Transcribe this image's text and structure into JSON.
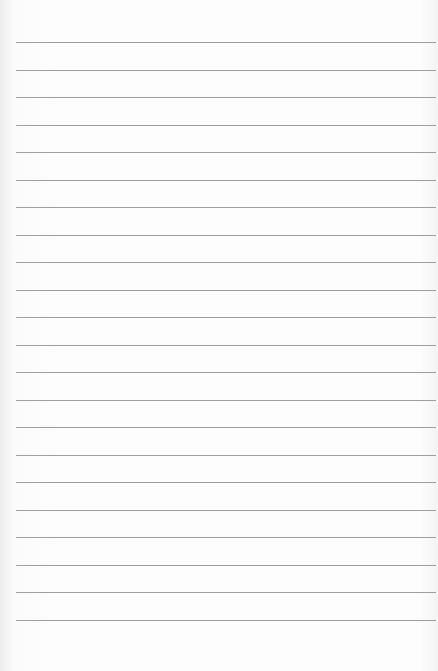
{
  "paper": {
    "type": "lined-paper",
    "background_color": "#fdfdfd",
    "line_color": "#9e9e9e",
    "line_count": 22,
    "first_line_y": 42,
    "line_spacing": 27.5,
    "line_left": 16,
    "line_right": 436,
    "text": ""
  }
}
